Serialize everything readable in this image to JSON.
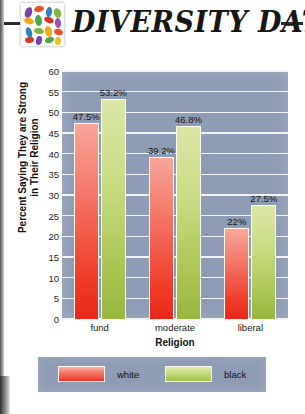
{
  "header": {
    "title": "DIVERSITY DATA",
    "logo_icon": "colorful-beads-tile-icon",
    "rule_left": "horizontal-rule",
    "rule_right": "horizontal-rule"
  },
  "chart_data": {
    "type": "bar",
    "title": "",
    "xlabel": "Religion",
    "ylabel": "Percent Saying They are Strong in Their Religion",
    "ylabel_line1": "Percent Saying They are Strong",
    "ylabel_line2": "in Their Religion",
    "categories": [
      "fund",
      "moderate",
      "liberal"
    ],
    "series": [
      {
        "name": "white",
        "color": "#ef3b28",
        "values": [
          47.5,
          39.2,
          22
        ],
        "labels": [
          "47.5%",
          "39.2%",
          "22%"
        ]
      },
      {
        "name": "black",
        "color": "#a8c44f",
        "values": [
          53.2,
          46.8,
          27.5
        ],
        "labels": [
          "53.2%",
          "46.8%",
          "27.5%"
        ]
      }
    ],
    "ylim": [
      0,
      60
    ],
    "yticks": [
      0,
      5,
      10,
      15,
      20,
      25,
      30,
      35,
      40,
      45,
      50,
      55,
      60
    ],
    "ytick_labels": [
      "0",
      "5",
      "10",
      "15",
      "20",
      "25",
      "30",
      "35",
      "40",
      "45",
      "50",
      "55",
      "60"
    ],
    "grid": true,
    "grid_axis": "y",
    "legend_position": "bottom",
    "plot_background": "#8e9cb5",
    "gridline_color": "#f2f4f7"
  },
  "legend": {
    "items": [
      {
        "label": "white",
        "swatch": "red-gradient-swatch"
      },
      {
        "label": "black",
        "swatch": "green-gradient-swatch"
      }
    ]
  }
}
